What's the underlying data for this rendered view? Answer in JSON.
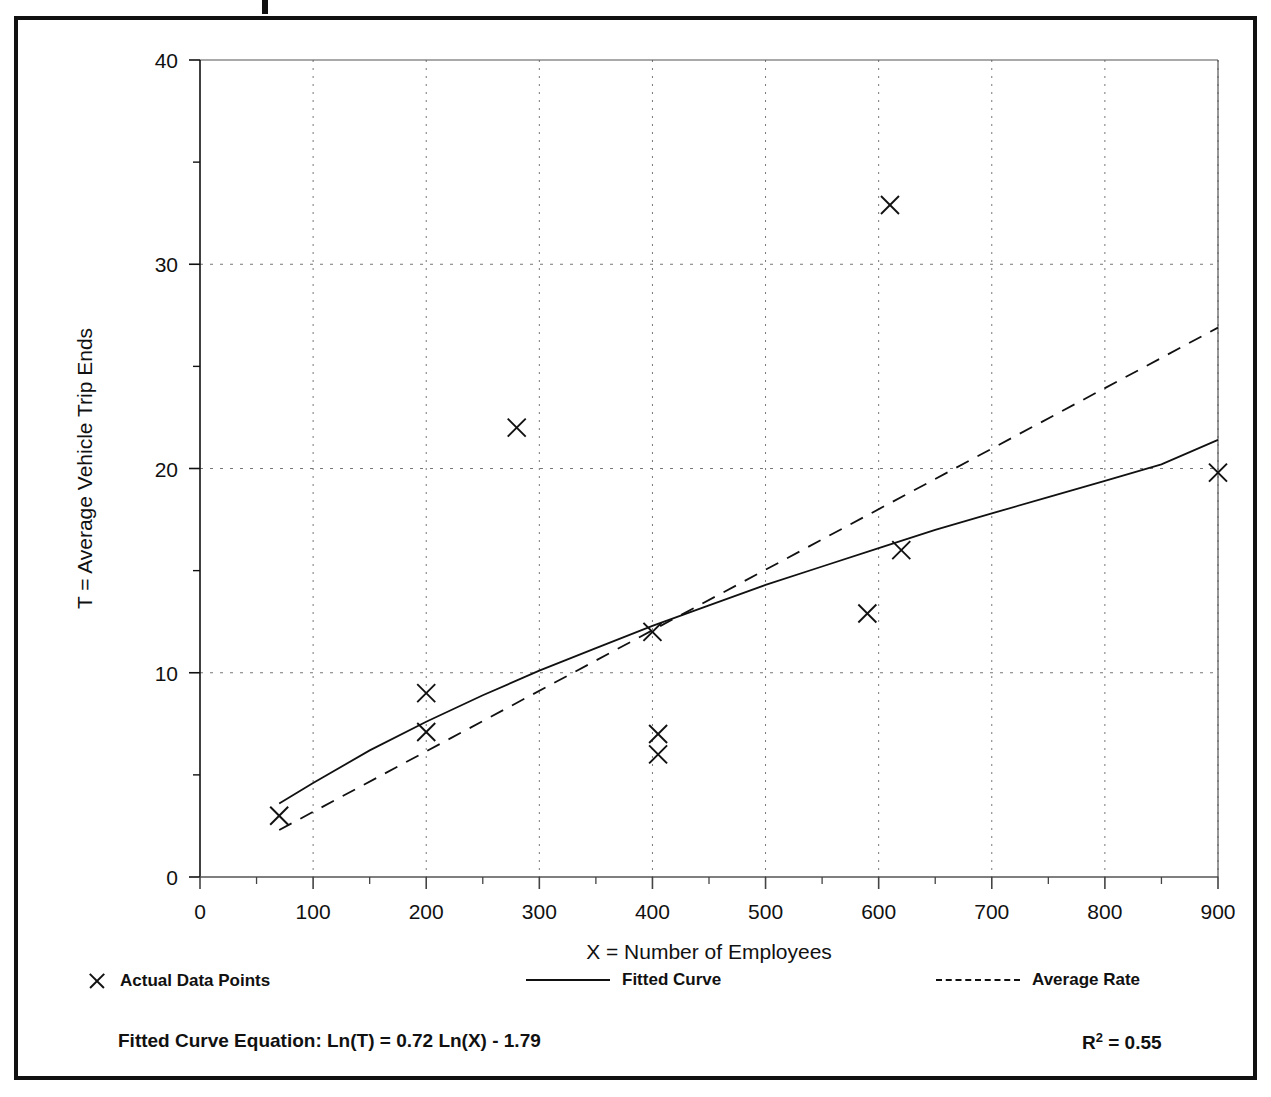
{
  "chart_data": {
    "type": "scatter",
    "title": "",
    "xlabel": "X = Number of Employees",
    "ylabel": "T = Average Vehicle Trip Ends",
    "xlim": [
      0,
      900
    ],
    "ylim": [
      0,
      40
    ],
    "x_ticks": [
      0,
      100,
      200,
      300,
      400,
      500,
      600,
      700,
      800,
      900
    ],
    "x_tick_labels": [
      "0",
      "100",
      "200",
      "300",
      "400",
      "500",
      "600",
      "700",
      "800",
      "900"
    ],
    "x_minor_step": 50,
    "y_ticks": [
      0,
      10,
      20,
      30,
      40
    ],
    "y_tick_labels": [
      "0",
      "10",
      "20",
      "30",
      "40"
    ],
    "y_minor_step": 5,
    "grid": true,
    "grid_style": "dotted",
    "legend_position": "below-axis",
    "series": [
      {
        "name": "Actual Data Points",
        "type": "scatter",
        "marker": "x",
        "points": [
          {
            "x": 70,
            "y": 3.0
          },
          {
            "x": 200,
            "y": 9.0
          },
          {
            "x": 200,
            "y": 7.1
          },
          {
            "x": 280,
            "y": 22.0
          },
          {
            "x": 400,
            "y": 12.0
          },
          {
            "x": 405,
            "y": 7.0
          },
          {
            "x": 405,
            "y": 6.0
          },
          {
            "x": 590,
            "y": 12.9
          },
          {
            "x": 610,
            "y": 32.9
          },
          {
            "x": 620,
            "y": 16.0
          },
          {
            "x": 900,
            "y": 19.8
          }
        ]
      },
      {
        "name": "Fitted Curve",
        "type": "line",
        "line_style": "solid",
        "equation": "Ln(T) = 0.72 Ln(X) - 1.79",
        "x_range": [
          70,
          900
        ],
        "points": [
          {
            "x": 70,
            "y": 3.6
          },
          {
            "x": 100,
            "y": 4.6
          },
          {
            "x": 150,
            "y": 6.2
          },
          {
            "x": 200,
            "y": 7.6
          },
          {
            "x": 250,
            "y": 8.9
          },
          {
            "x": 300,
            "y": 10.1
          },
          {
            "x": 350,
            "y": 11.2
          },
          {
            "x": 400,
            "y": 12.3
          },
          {
            "x": 450,
            "y": 13.3
          },
          {
            "x": 500,
            "y": 14.3
          },
          {
            "x": 550,
            "y": 15.2
          },
          {
            "x": 600,
            "y": 16.1
          },
          {
            "x": 650,
            "y": 17.0
          },
          {
            "x": 700,
            "y": 17.8
          },
          {
            "x": 750,
            "y": 18.6
          },
          {
            "x": 800,
            "y": 19.4
          },
          {
            "x": 850,
            "y": 20.2
          },
          {
            "x": 900,
            "y": 21.4
          }
        ]
      },
      {
        "name": "Average Rate",
        "type": "line",
        "line_style": "dashed",
        "x_range": [
          70,
          900
        ],
        "points": [
          {
            "x": 70,
            "y": 2.3
          },
          {
            "x": 900,
            "y": 26.9
          }
        ]
      }
    ]
  },
  "axis": {
    "y_title": "T = Average Vehicle Trip Ends",
    "x_title": "X = Number of Employees"
  },
  "legend": {
    "items": [
      {
        "label": "Actual Data Points",
        "marker": "x-marker"
      },
      {
        "label": "Fitted Curve",
        "marker": "solid-line"
      },
      {
        "label": "Average Rate",
        "marker": "dashed-line"
      }
    ]
  },
  "footer": {
    "equation_label": "Fitted Curve Equation:",
    "equation": "Ln(T) = 0.72 Ln(X) - 1.79",
    "equation_full": "Fitted Curve Equation:  Ln(T) = 0.72 Ln(X) - 1.79",
    "r_squared_symbol": "R",
    "r_squared_exp": "2",
    "r_squared_value": "= 0.55",
    "r_squared_full": "R2 = 0.55"
  },
  "colors": {
    "ink": "#111111",
    "grid": "#777777",
    "background": "#ffffff"
  }
}
